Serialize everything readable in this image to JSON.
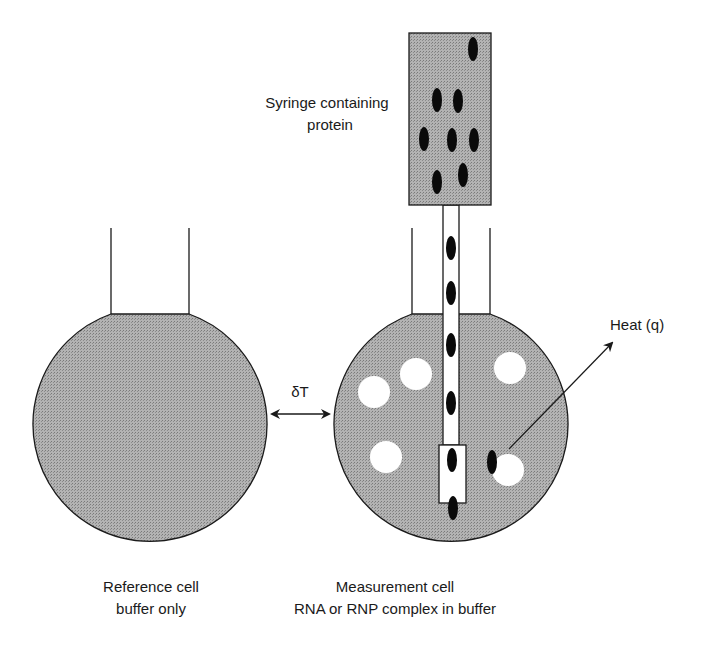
{
  "labels": {
    "syringe_line1": "Syringe containing",
    "syringe_line2": "protein",
    "delta_t": "δT",
    "heat": "Heat (q)",
    "reference_line1": "Reference cell",
    "reference_line2": "buffer only",
    "measurement_line1": "Measurement cell",
    "measurement_line2": "RNA or RNP complex in buffer"
  },
  "colors": {
    "fill_gray": "#a9a9a9",
    "stroke": "#1a1a1a",
    "protein": "#0a0a0a",
    "ligand": "#ffffff"
  },
  "geometry": {
    "reference_cell": {
      "cx": 151,
      "cy": 419,
      "r": 117,
      "neck_left": 111,
      "neck_right": 189,
      "neck_top": 228
    },
    "measurement_cell": {
      "cx": 453,
      "cy": 419,
      "r": 117,
      "neck_left": 412,
      "neck_right": 490,
      "neck_top": 228
    },
    "syringe": {
      "x": 409,
      "y": 33,
      "w": 82,
      "h": 172
    },
    "needle": {
      "x1": 443,
      "x2": 459,
      "y_top": 205,
      "y_bottom": 445
    },
    "needle_tip": {
      "x": 439,
      "y": 445,
      "w": 27,
      "h": 58
    },
    "syringe_proteins": [
      [
        473,
        49
      ],
      [
        437,
        100
      ],
      [
        458,
        101
      ],
      [
        424,
        139
      ],
      [
        452,
        140
      ],
      [
        474,
        140
      ],
      [
        437,
        182
      ],
      [
        463,
        175
      ]
    ],
    "needle_proteins": [
      [
        451,
        248
      ],
      [
        451,
        293
      ],
      [
        451,
        345
      ],
      [
        451,
        403
      ],
      [
        452,
        460
      ],
      [
        453,
        508
      ]
    ],
    "free_proteins": [
      [
        492,
        462
      ]
    ],
    "ligands": [
      [
        374,
        392
      ],
      [
        416,
        374
      ],
      [
        510,
        368
      ],
      [
        386,
        457
      ],
      [
        508,
        470
      ]
    ],
    "delta_t_arrow": {
      "x1": 270,
      "x2": 331,
      "y": 414
    },
    "heat_arrow": {
      "x1": 509,
      "y1": 449,
      "x2": 612,
      "y2": 343
    }
  }
}
